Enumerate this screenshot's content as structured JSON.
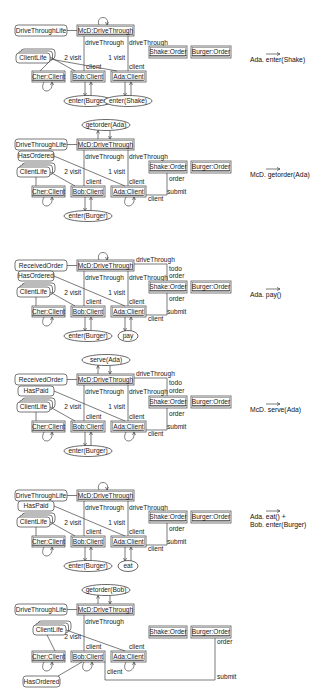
{
  "diagram": {
    "panels": [
      {
        "id": "p1",
        "y": 0,
        "step_label": [
          "Ada. enter(Shake)"
        ],
        "drive_state": "DriveThroughLife",
        "drive_node": "McD:DriveThrough",
        "drive_self_loop": true,
        "drive_action": "",
        "clients": [
          "Cher:Client",
          "Bob:Client",
          "Ada:Client"
        ],
        "client_state_labels": [
          {
            "label": "ClientLife",
            "stacked": true
          }
        ],
        "orders": [
          "Shake:Order",
          "Burger:Order"
        ],
        "edge_labels": {
          "bob_drive": "driveThrough",
          "bob_visit": "2 visit",
          "bob_client": "client",
          "ada_drive": "driveThrough",
          "ada_visit": "1 visit",
          "ada_client": "client"
        },
        "actions": [
          {
            "node": "Bob",
            "label": "enter(Burger)"
          },
          {
            "node": "Ada",
            "label": "enter(Shake)"
          }
        ]
      },
      {
        "id": "p2",
        "y": 115,
        "step_label": [
          "McD. getorder(Ada)"
        ],
        "drive_state": "DriveThroughLife",
        "drive_node": "McD:DriveThrough",
        "drive_action": "getorder(Ada)",
        "clients": [
          "Cher:Client",
          "Bob:Client",
          "Ada:Client"
        ],
        "client_state_labels": [
          {
            "label": "HasOrdered"
          },
          {
            "label": "ClientLife"
          }
        ],
        "orders": [
          "Shake:Order",
          "Burger:Order"
        ],
        "edge_labels": {
          "bob_drive": "driveThrough",
          "bob_visit": "2 visit",
          "bob_client": "client",
          "ada_drive": "driveThrough",
          "ada_visit": "1 visit",
          "ada_client": "client",
          "order": "order",
          "submit": "submit",
          "client2": "client"
        },
        "actions": [
          {
            "node": "Bob",
            "label": "enter(Burger)"
          }
        ]
      },
      {
        "id": "p3",
        "y": 235,
        "step_label": [
          "Ada. pay()"
        ],
        "drive_state": "ReceivedOrder",
        "drive_node": "McD:DriveThrough",
        "drive_self_loop": true,
        "clients": [
          "Cher:Client",
          "Bob:Client",
          "Ada:Client"
        ],
        "client_state_labels": [
          {
            "label": "HasOrdered"
          },
          {
            "label": "ClientLife"
          }
        ],
        "orders": [
          "Shake:Order",
          "Burger:Order"
        ],
        "edge_labels": {
          "bob_drive": "driveThrough",
          "bob_visit": "2 visit",
          "bob_client": "client",
          "ada_drive": "driveThrough",
          "ada_visit": "1 visit",
          "ada_client": "client",
          "todo_drive": "driveThrough",
          "todo": "todo",
          "todo_order": "order",
          "order": "order",
          "submit": "submit",
          "client2": "client"
        },
        "actions": [
          {
            "node": "Bob",
            "label": "enter(Burger)"
          },
          {
            "node": "Ada",
            "label": "pay"
          }
        ]
      },
      {
        "id": "p4",
        "y": 350,
        "step_label": [
          "McD. serve(Ada)"
        ],
        "drive_state": "ReceivedOrder",
        "drive_node": "McD:DriveThrough",
        "drive_action": "serve(Ada)",
        "clients": [
          "Cher:Client",
          "Bob:Client",
          "Ada:Client"
        ],
        "client_state_labels": [
          {
            "label": "HasPaid"
          },
          {
            "label": "ClientLife"
          }
        ],
        "orders": [
          "Shake:Order",
          "Burger:Order"
        ],
        "edge_labels": {
          "bob_drive": "driveThrough",
          "bob_visit": "2 visit",
          "bob_client": "client",
          "ada_drive": "driveThrough",
          "ada_visit": "1 visit",
          "ada_client": "client",
          "todo_drive": "driveThrough",
          "todo": "todo",
          "todo_order": "order",
          "order": "order",
          "submit": "submit",
          "client2": "client"
        },
        "actions": [
          {
            "node": "Bob",
            "label": "enter(Burger)"
          }
        ]
      },
      {
        "id": "p5",
        "y": 465,
        "step_label": [
          "Ada. eat() +",
          "Bob. enter(Burger)"
        ],
        "drive_state": "DriveThroughLife",
        "drive_node": "McD:DriveThrough",
        "drive_self_loop": true,
        "clients": [
          "Cher:Client",
          "Bob:Client",
          "Ada:Client"
        ],
        "client_state_labels": [
          {
            "label": "HasPaid"
          },
          {
            "label": "ClientLife"
          }
        ],
        "orders": [
          "Shake:Order",
          "Burger:Order"
        ],
        "edge_labels": {
          "bob_drive": "driveThrough",
          "bob_visit": "2 visit",
          "bob_client": "client",
          "ada_drive": "driveThrough",
          "ada_visit": "1 visit",
          "ada_client": "client",
          "order": "order",
          "submit": "submit",
          "client2": "client"
        },
        "actions": [
          {
            "node": "Bob",
            "label": "enter(Burger)"
          },
          {
            "node": "Ada",
            "label": "eat"
          }
        ]
      },
      {
        "id": "p6",
        "y": 580,
        "step_label": [],
        "drive_state": "DriveThroughLife",
        "drive_node": "McD:DriveThrough",
        "drive_action": "getorder(Bob)",
        "clients": [
          "Cher:Client",
          "Bob:Client",
          "Ada:Client"
        ],
        "client_state_labels": [
          {
            "label": "ClientLife"
          },
          {
            "label": "HasOrdered"
          }
        ],
        "orders": [
          "Shake:Order",
          "Burger:Order"
        ],
        "edge_labels": {
          "bob_drive": "driveThrough",
          "bob_visit": "2 visit",
          "bob_client": "client",
          "ada_client": "client",
          "order": "order",
          "submit": "submit",
          "client2": "client"
        },
        "actions": []
      }
    ]
  }
}
